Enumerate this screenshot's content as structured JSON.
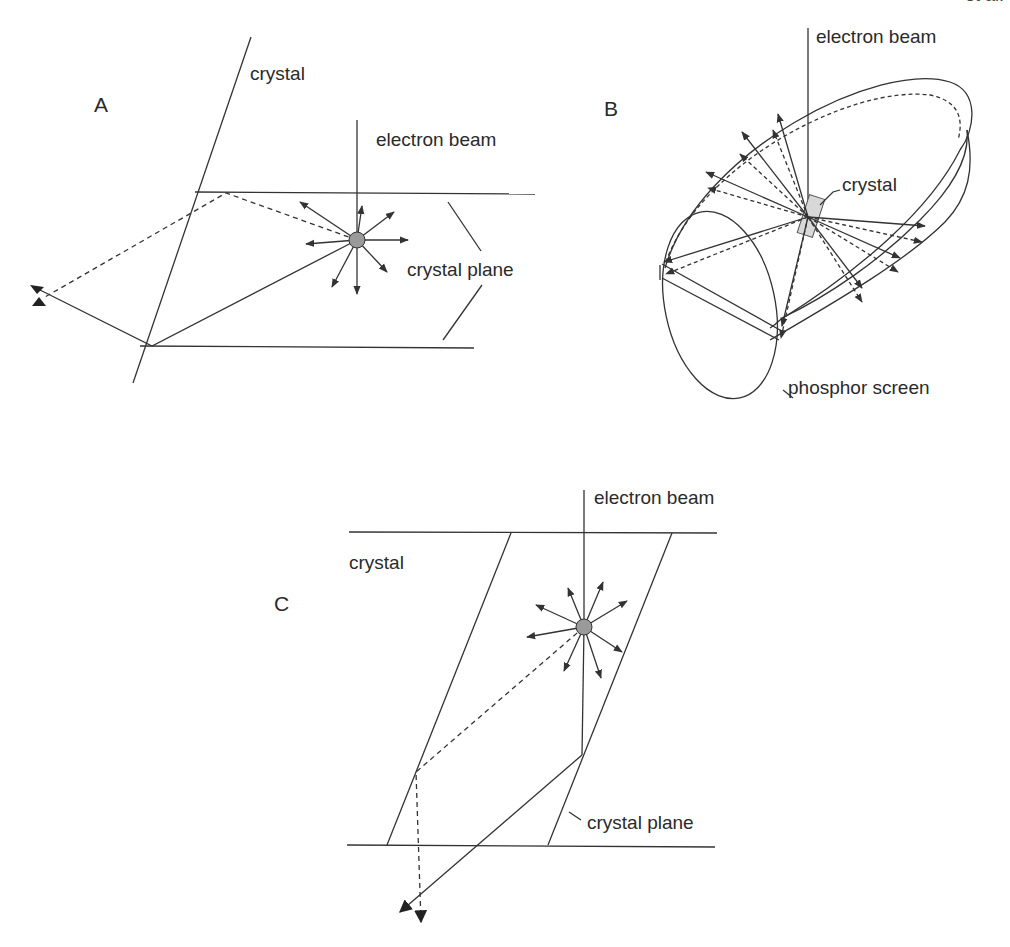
{
  "header": {
    "fragment": "et al."
  },
  "panels": {
    "A": {
      "letter": "A",
      "labels": {
        "crystal": "crystal",
        "beam": "electron beam",
        "plane": "crystal plane"
      }
    },
    "B": {
      "letter": "B",
      "labels": {
        "beam": "electron beam",
        "crystal": "crystal",
        "screen": "phosphor screen"
      }
    },
    "C": {
      "letter": "C",
      "labels": {
        "crystal": "crystal",
        "beam": "electron beam",
        "plane": "crystal plane"
      }
    }
  },
  "colors": {
    "line": "#333333",
    "source_fill": "#9a9a9a",
    "crystal_fill": "#d8d8d8"
  }
}
